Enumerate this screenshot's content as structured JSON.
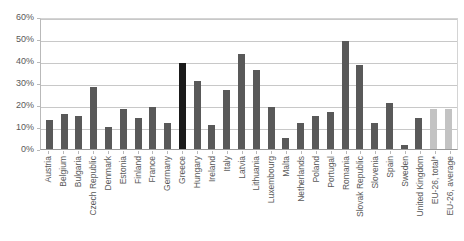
{
  "chart_data": {
    "type": "bar",
    "title": "",
    "subtitle": "",
    "xlabel": "",
    "ylabel": "",
    "ylim": [
      0,
      60
    ],
    "y_tick_labels": [
      "60%",
      "50%",
      "40%",
      "30%",
      "20%",
      "10%",
      "0%"
    ],
    "y_tick_values": [
      60,
      50,
      40,
      30,
      20,
      10,
      0
    ],
    "grid": true,
    "legend": "none",
    "value_suffix": "%",
    "categories": [
      "Austria",
      "Belgium",
      "Bulgaria",
      "Czech Republic",
      "Denmark",
      "Estonia",
      "Finland",
      "France",
      "Germany",
      "Greece",
      "Hungary",
      "Ireland",
      "Italy",
      "Latvia",
      "Lithuania",
      "Luxembourg",
      "Malta",
      "Netherlands",
      "Poland",
      "Portugal",
      "Romania",
      "Slovak Republic",
      "Slovenia",
      "Spain",
      "Sweden",
      "United Kingdom",
      "EU-26, total*",
      "EU-26, average"
    ],
    "values": [
      13,
      16,
      15,
      28,
      10,
      18,
      14,
      19,
      12,
      39,
      31,
      11,
      27,
      43,
      36,
      19,
      5,
      12,
      15,
      17,
      49,
      38,
      12,
      21,
      2,
      14,
      18,
      18
    ],
    "bar_styles": [
      "normal",
      "normal",
      "normal",
      "normal",
      "normal",
      "normal",
      "normal",
      "normal",
      "normal",
      "highlight",
      "normal",
      "normal",
      "normal",
      "normal",
      "normal",
      "normal",
      "normal",
      "normal",
      "normal",
      "normal",
      "normal",
      "normal",
      "normal",
      "normal",
      "normal",
      "normal",
      "aggregate",
      "aggregate"
    ]
  },
  "colors": {
    "bar_normal": "#595959",
    "bar_highlight": "#1a1a1a",
    "bar_aggregate": "#c3c3c3",
    "gridline": "#c8c8c8",
    "axis": "#9a9a9a",
    "text": "#595959",
    "background": "#ffffff"
  }
}
